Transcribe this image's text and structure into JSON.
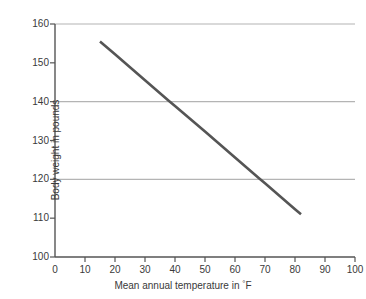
{
  "chart_data": {
    "type": "line",
    "title": "",
    "subtitle": "",
    "xlabel": "Mean annual temperature in °F",
    "ylabel": "Body weight in pounds",
    "xlim": [
      0,
      100
    ],
    "ylim": [
      100,
      160
    ],
    "xticks": [
      0,
      10,
      20,
      30,
      40,
      50,
      60,
      70,
      80,
      90,
      100
    ],
    "yticks": [
      100,
      110,
      120,
      130,
      140,
      150,
      160
    ],
    "xtick_labels": [
      "0",
      "10",
      "20",
      "30",
      "40",
      "50",
      "60",
      "70",
      "80",
      "90",
      "100"
    ],
    "ytick_labels": [
      "100",
      "110",
      "120",
      "130",
      "140",
      "150",
      "160"
    ],
    "grid": {
      "horizontal": true,
      "vertical": false,
      "gridline_values": [
        120,
        140,
        160
      ],
      "color": "#b4b4b4"
    },
    "legend": {
      "visible": false,
      "position": "none"
    },
    "series": [
      {
        "name": "Body weight vs mean annual temperature",
        "color": "#555555",
        "line_width": 2.6,
        "x": [
          15,
          82
        ],
        "values": [
          155.5,
          111.0
        ],
        "points": [
          {
            "x": 15,
            "y": 155.5
          },
          {
            "x": 20,
            "y": 152.2
          },
          {
            "x": 30,
            "y": 145.5
          },
          {
            "x": 38,
            "y": 140.2
          },
          {
            "x": 40,
            "y": 138.9
          },
          {
            "x": 50,
            "y": 132.3
          },
          {
            "x": 60,
            "y": 125.6
          },
          {
            "x": 68,
            "y": 120.3
          },
          {
            "x": 70,
            "y": 119.0
          },
          {
            "x": 80,
            "y": 112.3
          },
          {
            "x": 82,
            "y": 111.0
          }
        ],
        "slope_per_degF": -0.664,
        "intercept": 165.46
      }
    ],
    "annotations": []
  },
  "axes": {
    "axis_color": "#555555",
    "tick_color": "#555555",
    "background": "#ffffff",
    "text_color": "#3a3a3a"
  }
}
